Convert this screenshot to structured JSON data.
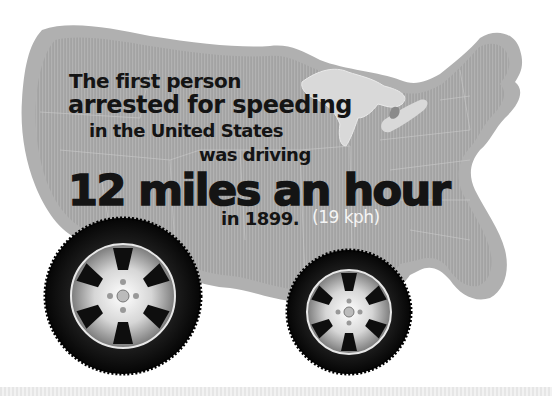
{
  "infographic": {
    "lines": [
      "The first person",
      "arrested for speeding",
      "in the United States",
      "was driving",
      "12 miles an hour",
      "in 1899.",
      "(19 kph)"
    ]
  },
  "illustration": {
    "map": "us-map-silhouette",
    "wheels": [
      "left-wheel",
      "right-wheel"
    ]
  },
  "colors": {
    "map_fill": "#9a9a9a",
    "map_border": "#b3b3b3",
    "text": "#141414",
    "text_light": "#f4f4f4",
    "tire": "#111111",
    "rim": "#cfcfcf"
  }
}
